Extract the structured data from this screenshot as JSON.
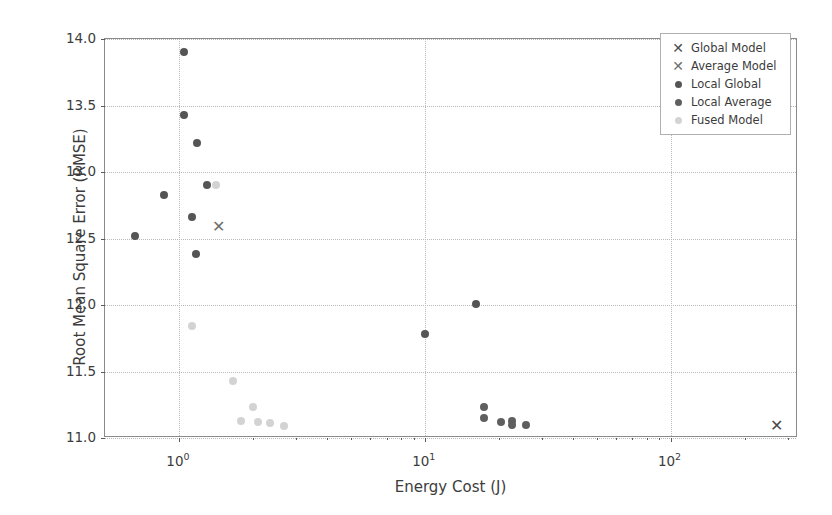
{
  "chart_data": {
    "type": "scatter",
    "title": "",
    "xlabel": "Energy Cost (J)",
    "ylabel": "Root Mean Square Error (RMSE)",
    "xscale": "log",
    "yscale": "linear",
    "xlim": [
      0.5,
      330
    ],
    "ylim": [
      11.0,
      14.0
    ],
    "grid": true,
    "legend_position": "upper right",
    "xticks": [
      1,
      10,
      100
    ],
    "xticklabels": [
      "10⁰",
      "10¹",
      "10²"
    ],
    "yticks": [
      11.0,
      11.5,
      12.0,
      12.5,
      13.0,
      13.5,
      14.0
    ],
    "yticklabels": [
      "11.0",
      "11.5",
      "12.0",
      "12.5",
      "13.0",
      "13.5",
      "14.0"
    ],
    "series": [
      {
        "name": "Global Model",
        "marker": "x",
        "color": "#4a4a4a",
        "points": [
          [
            270,
            11.09
          ]
        ]
      },
      {
        "name": "Average Model",
        "marker": "x",
        "color": "#6e6e6e",
        "points": [
          [
            1.45,
            12.59
          ]
        ]
      },
      {
        "name": "Local Global",
        "marker": "o",
        "color": "#555555",
        "points": [
          [
            1.05,
            13.9
          ],
          [
            1.05,
            13.43
          ],
          [
            1.18,
            13.22
          ],
          [
            0.87,
            12.83
          ],
          [
            1.3,
            12.9
          ],
          [
            1.13,
            12.66
          ],
          [
            0.66,
            12.52
          ],
          [
            1.17,
            12.38
          ],
          [
            16.2,
            12.01
          ],
          [
            10.0,
            11.78
          ]
        ]
      },
      {
        "name": "Local Average",
        "marker": "o",
        "color": "#5f5f5f",
        "points": [
          [
            17.4,
            11.23
          ],
          [
            17.4,
            11.15
          ],
          [
            20.5,
            11.12
          ],
          [
            22.6,
            11.13
          ],
          [
            22.6,
            11.1
          ],
          [
            25.8,
            11.1
          ]
        ]
      },
      {
        "name": "Fused Model",
        "marker": "o",
        "color": "#d3d3d3",
        "points": [
          [
            1.42,
            12.9
          ],
          [
            1.13,
            11.84
          ],
          [
            1.66,
            11.43
          ],
          [
            2.0,
            11.23
          ],
          [
            1.78,
            11.13
          ],
          [
            2.1,
            11.12
          ],
          [
            2.35,
            11.11
          ],
          [
            2.68,
            11.09
          ]
        ]
      }
    ]
  },
  "legend": {
    "entries": [
      {
        "label": "Global Model",
        "marker": "x",
        "color": "#4a4a4a"
      },
      {
        "label": "Average Model",
        "marker": "x",
        "color": "#6e6e6e"
      },
      {
        "label": "Local Global",
        "marker": "o",
        "color": "#555555"
      },
      {
        "label": "Local Average",
        "marker": "o",
        "color": "#5f5f5f"
      },
      {
        "label": "Fused Model",
        "marker": "o",
        "color": "#d3d3d3"
      }
    ]
  }
}
